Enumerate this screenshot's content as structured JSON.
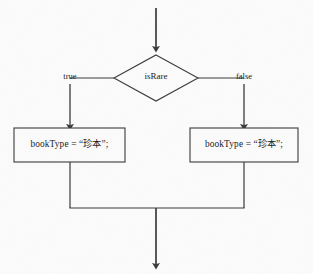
{
  "diagram": {
    "type": "flowchart",
    "canvas": {
      "width": 313,
      "height": 274,
      "background": "#fbfbfb"
    },
    "stroke_color": "#3a3a3a",
    "text_color": "#1a1a1a",
    "nodes": {
      "decision": {
        "shape": "diamond",
        "label": "isRare",
        "cx": 156,
        "cy": 78,
        "half_width": 42,
        "half_height": 23
      },
      "true_branch_box": {
        "shape": "rectangle",
        "label": "bookType = “珍本”;",
        "x": 14,
        "y": 128,
        "width": 111,
        "height": 34
      },
      "false_branch_box": {
        "shape": "rectangle",
        "label": "bookType = “珍本”;",
        "x": 190,
        "y": 128,
        "width": 108,
        "height": 34
      }
    },
    "edges": {
      "entry": {
        "label": "",
        "from_y": 8,
        "to_y": 50,
        "x": 156,
        "arrow": true
      },
      "true_edge": {
        "label": "true",
        "label_x": 70,
        "label_y": 78,
        "branch_x": 70,
        "arrow": true
      },
      "false_edge": {
        "label": "false",
        "label_x": 244,
        "label_y": 78,
        "branch_x": 244,
        "arrow": true
      },
      "merge_bar": {
        "y": 208,
        "x_start": 70,
        "x_end": 244
      },
      "exit": {
        "label": "",
        "from_y": 208,
        "to_y": 268,
        "x": 156,
        "arrow": true
      }
    }
  }
}
